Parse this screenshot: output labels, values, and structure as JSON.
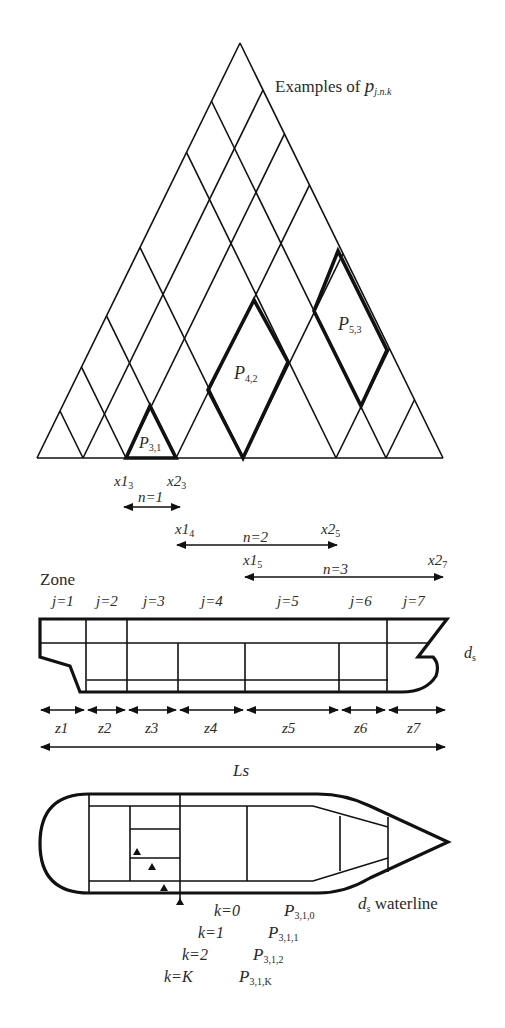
{
  "title": {
    "text": "Examples of ",
    "symbol": "p",
    "subscript": "j.n.k"
  },
  "triangle": {
    "apex": [
      240,
      43
    ],
    "base_y": 458,
    "base_points": [
      37,
      83,
      126,
      176,
      243,
      336,
      386,
      443
    ],
    "highlighted": [
      {
        "label": "P",
        "sub": "3,1",
        "points": [
          [
            126,
            458
          ],
          [
            150,
            406
          ],
          [
            176,
            458
          ]
        ]
      },
      {
        "label": "P",
        "sub": "4,2",
        "points": [
          [
            243,
            458
          ],
          [
            208,
            390
          ],
          [
            254,
            300
          ],
          [
            288,
            362
          ]
        ]
      },
      {
        "label": "P",
        "sub": "5,3",
        "points": [
          [
            361,
            406
          ],
          [
            314,
            311
          ],
          [
            338,
            251
          ],
          [
            387,
            350
          ]
        ]
      }
    ]
  },
  "intervals": [
    {
      "n_label": "n=1",
      "x1": "x1",
      "x1_sub": "3",
      "x2": "x2",
      "x2_sub": "3"
    },
    {
      "n_label": "n=2",
      "x1": "x1",
      "x1_sub": "4",
      "x2": "x2",
      "x2_sub": "5"
    },
    {
      "n_label": "n=3",
      "x1": "x1",
      "x1_sub": "5",
      "x2": "x2",
      "x2_sub": "7"
    }
  ],
  "zone": {
    "title": "Zone",
    "j_labels": [
      "j=1",
      "j=2",
      "j=3",
      "j=4",
      "j=5",
      "j=6",
      "j=7"
    ],
    "z_labels": [
      "z1",
      "z2",
      "z3",
      "z4",
      "z5",
      "z6",
      "z7"
    ],
    "length_label": "Ls",
    "draft_label": {
      "symbol": "d",
      "sub": "s"
    }
  },
  "plan": {
    "waterline_label": {
      "symbol": "d",
      "sub": "s",
      "text": " waterline"
    },
    "k_labels": [
      "k=0",
      "k=1",
      "k=2",
      "k=K"
    ],
    "p_labels": [
      {
        "symbol": "P",
        "sub": "3,1,0"
      },
      {
        "symbol": "P",
        "sub": "3,1,1"
      },
      {
        "symbol": "P",
        "sub": "3,1,2"
      },
      {
        "symbol": "P",
        "sub": "3,1,K"
      }
    ]
  }
}
